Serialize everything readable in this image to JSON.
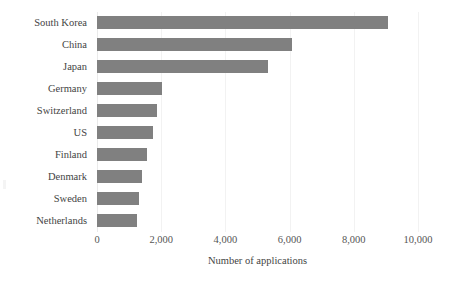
{
  "chart_data": {
    "type": "bar",
    "orientation": "horizontal",
    "title": "",
    "xlabel": "Number of applications",
    "ylabel": "",
    "categories": [
      "South Korea",
      "China",
      "Japan",
      "Germany",
      "Switzerland",
      "US",
      "Finland",
      "Denmark",
      "Sweden",
      "Netherlands"
    ],
    "values": [
      9060,
      6080,
      5330,
      2030,
      1870,
      1750,
      1560,
      1400,
      1300,
      1240
    ],
    "xlim": [
      0,
      10000
    ],
    "xticks": [
      0,
      2000,
      4000,
      6000,
      8000,
      10000
    ],
    "xtick_labels": [
      "0",
      "2,000",
      "4,000",
      "6,000",
      "8,000",
      "10,000"
    ],
    "grid": "vertical-only",
    "legend": "none",
    "bar_color": "#808080",
    "gridline_color": "#f2f2f2",
    "label_color": "#444444",
    "background_color": "#ffffff"
  }
}
